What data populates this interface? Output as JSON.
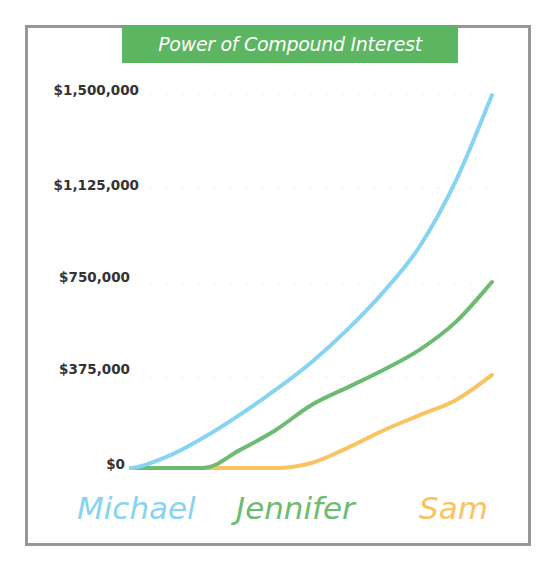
{
  "title": "Power of Compound Interest",
  "colors": {
    "banner": "#5cb561",
    "frame": "#9a9696",
    "michael": "#87d4f2",
    "jennifer": "#6dbb72",
    "sam": "#f8c461",
    "tick_text": "#333333"
  },
  "legend": {
    "michael": "Michael",
    "jennifer": "Jennifer",
    "sam": "Sam"
  },
  "y_ticks": [
    "$1,500,000",
    "$1,125,000",
    "$750,000",
    "$375,000",
    "$0"
  ],
  "chart_data": {
    "type": "line",
    "title": "Power of Compound Interest",
    "xlabel": "",
    "ylabel": "",
    "x": [
      0,
      1,
      2,
      3,
      4,
      5,
      6,
      7,
      8,
      9,
      10
    ],
    "ylim": [
      0,
      1500000
    ],
    "yticks": [
      0,
      375000,
      750000,
      1125000,
      1500000
    ],
    "ytick_labels": [
      "$0",
      "$375,000",
      "$750,000",
      "$1,125,000",
      "$1,500,000"
    ],
    "grid": true,
    "legend_position": "bottom",
    "series": [
      {
        "name": "Michael",
        "color": "#87d4f2",
        "values": [
          0,
          45000,
          120000,
          210000,
          310000,
          420000,
          550000,
          700000,
          880000,
          1140000,
          1480000
        ]
      },
      {
        "name": "Jennifer",
        "color": "#6dbb72",
        "values": [
          0,
          0,
          0,
          70000,
          150000,
          250000,
          320000,
          390000,
          470000,
          580000,
          738000
        ]
      },
      {
        "name": "Sam",
        "color": "#f8c461",
        "values": [
          0,
          0,
          0,
          0,
          0,
          20000,
          80000,
          150000,
          210000,
          270000,
          369000
        ]
      }
    ]
  }
}
